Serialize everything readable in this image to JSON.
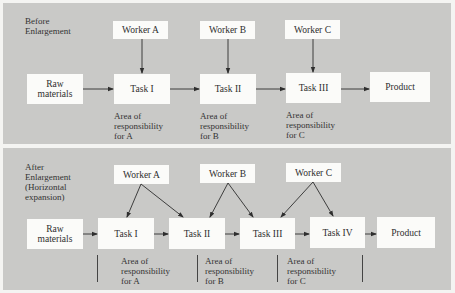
{
  "before": {
    "title_line1": "Before",
    "title_line2": "Enlargement",
    "workers": [
      "Worker A",
      "Worker B",
      "Worker C"
    ],
    "flow": {
      "raw_line1": "Raw",
      "raw_line2": "materials",
      "tasks": [
        "Task I",
        "Task II",
        "Task III"
      ],
      "product": "Product"
    },
    "areas": [
      {
        "l1": "Area of",
        "l2": "responsibility",
        "l3": "for A"
      },
      {
        "l1": "Area of",
        "l2": "responsibility",
        "l3": "for B"
      },
      {
        "l1": "Area of",
        "l2": "responsibility",
        "l3": "for C"
      }
    ]
  },
  "after": {
    "title_line1": "After",
    "title_line2": "Enlargement",
    "title_line3": "(Horizontal",
    "title_line4": "expansion)",
    "workers": [
      "Worker A",
      "Worker B",
      "Worker C"
    ],
    "flow": {
      "raw_line1": "Raw",
      "raw_line2": "materials",
      "tasks": [
        "Task I",
        "Task II",
        "Task III",
        "Task IV"
      ],
      "product": "Product"
    },
    "areas": [
      {
        "l1": "Area of",
        "l2": "responsibility",
        "l3": "for A"
      },
      {
        "l1": "Area of",
        "l2": "responsibility",
        "l3": "for B"
      },
      {
        "l1": "Area of",
        "l2": "responsibility",
        "l3": "for C"
      }
    ]
  },
  "colors": {
    "panel_bg": "#c9c9c7",
    "box_bg": "#fbfbf9",
    "line": "#333333",
    "page_bg": "#f4f4f2"
  }
}
